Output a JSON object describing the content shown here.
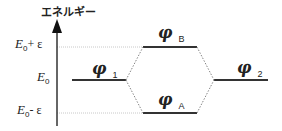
{
  "axis": {
    "title": "エネルギー",
    "levels": [
      {
        "name": "E",
        "sub": "0",
        "suffix": "+ ε"
      },
      {
        "name": "E",
        "sub": "0",
        "suffix": ""
      },
      {
        "name": "E",
        "sub": "0",
        "suffix": "- ε"
      }
    ]
  },
  "orbitals": {
    "phi1": {
      "symbol": "φ",
      "sub": "1"
    },
    "phiB": {
      "symbol": "φ",
      "sub": "B"
    },
    "phiA": {
      "symbol": "φ",
      "sub": "A"
    },
    "phi2": {
      "symbol": "φ",
      "sub": "2"
    }
  },
  "colors": {
    "line": "#333333",
    "guide": "#c8c8c8"
  }
}
